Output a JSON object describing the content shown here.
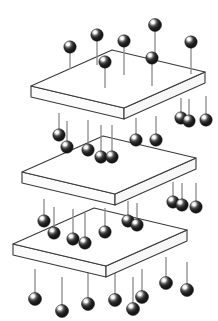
{
  "figure": {
    "title": "Three stacked plates with pin-mounted spheres",
    "background_color": "#ffffff",
    "width": 218,
    "height": 321,
    "style": {
      "plate_fill": "#ffffff",
      "plate_side_fill": "#f7f7f7",
      "plate_stroke": "#3a3a3a",
      "pin_color": "#8a8a8a",
      "sphere_dark": "#1b1b1b",
      "sphere_mid": "#3d3d3d",
      "sphere_highlight": "#ffffff",
      "sphere_outline": "#111111"
    },
    "counts": {
      "plate_count": 3,
      "sphere_count": 46,
      "pin_count": 46
    },
    "plates": [
      {
        "name": "top-plate",
        "label": "Top plate",
        "left_x": 31,
        "left_y": 86,
        "back_x": 112,
        "back_y": 50,
        "right_x": 205,
        "right_y": 72,
        "front_x": 124,
        "front_y": 108,
        "thickness": 11
      },
      {
        "name": "middle-plate",
        "label": "Middle plate",
        "left_x": 22,
        "left_y": 172,
        "back_x": 103,
        "back_y": 136,
        "right_x": 196,
        "right_y": 158,
        "front_x": 115,
        "front_y": 194,
        "thickness": 11
      },
      {
        "name": "bottom-plate",
        "label": "Bottom plate",
        "left_x": 13,
        "left_y": 244,
        "back_x": 94,
        "back_y": 208,
        "right_x": 187,
        "right_y": 230,
        "front_x": 106,
        "front_y": 266,
        "thickness": 11
      }
    ],
    "pins": [
      {
        "group": "top-above",
        "sx": 70,
        "sy": 47,
        "r": 6.2,
        "stem_len": 22
      },
      {
        "group": "top-above",
        "sx": 97,
        "sy": 35,
        "r": 6.2,
        "stem_len": 30
      },
      {
        "group": "top-above",
        "sx": 105,
        "sy": 62,
        "r": 6.2,
        "stem_len": 26
      },
      {
        "group": "top-above",
        "sx": 124,
        "sy": 41,
        "r": 6.2,
        "stem_len": 34
      },
      {
        "group": "top-above",
        "sx": 155,
        "sy": 25,
        "r": 6.5,
        "stem_len": 36
      },
      {
        "group": "top-above",
        "sx": 152,
        "sy": 58,
        "r": 6.2,
        "stem_len": 28
      },
      {
        "group": "top-above",
        "sx": 191,
        "sy": 42,
        "r": 6.2,
        "stem_len": 32
      },
      {
        "group": "top-below",
        "sx": 59,
        "sy": 135,
        "r": 6.2,
        "stem_len": 22
      },
      {
        "group": "top-below",
        "sx": 67,
        "sy": 147,
        "r": 6.2,
        "stem_len": 26
      },
      {
        "group": "top-below",
        "sx": 88,
        "sy": 150,
        "r": 6.2,
        "stem_len": 30
      },
      {
        "group": "top-below",
        "sx": 101,
        "sy": 157,
        "r": 6.2,
        "stem_len": 32
      },
      {
        "group": "top-below",
        "sx": 112,
        "sy": 157,
        "r": 6.2,
        "stem_len": 32
      },
      {
        "group": "top-below",
        "sx": 136,
        "sy": 140,
        "r": 6.2,
        "stem_len": 22
      },
      {
        "group": "top-below",
        "sx": 156,
        "sy": 140,
        "r": 6.2,
        "stem_len": 24
      },
      {
        "group": "top-below",
        "sx": 181,
        "sy": 118,
        "r": 6.2,
        "stem_len": 20
      },
      {
        "group": "top-below",
        "sx": 189,
        "sy": 121,
        "r": 6.2,
        "stem_len": 22
      },
      {
        "group": "top-below",
        "sx": 206,
        "sy": 120,
        "r": 6.2,
        "stem_len": 24
      },
      {
        "group": "mid-below",
        "sx": 44,
        "sy": 221,
        "r": 6.2,
        "stem_len": 22
      },
      {
        "group": "mid-below",
        "sx": 54,
        "sy": 233,
        "r": 6.2,
        "stem_len": 26
      },
      {
        "group": "mid-below",
        "sx": 73,
        "sy": 239,
        "r": 6.2,
        "stem_len": 30
      },
      {
        "group": "mid-below",
        "sx": 85,
        "sy": 243,
        "r": 6.2,
        "stem_len": 30
      },
      {
        "group": "mid-below",
        "sx": 105,
        "sy": 232,
        "r": 6.2,
        "stem_len": 24
      },
      {
        "group": "mid-below",
        "sx": 128,
        "sy": 221,
        "r": 6.2,
        "stem_len": 20
      },
      {
        "group": "mid-below",
        "sx": 137,
        "sy": 225,
        "r": 6.2,
        "stem_len": 22
      },
      {
        "group": "mid-below",
        "sx": 173,
        "sy": 202,
        "r": 6.2,
        "stem_len": 20
      },
      {
        "group": "mid-below",
        "sx": 182,
        "sy": 205,
        "r": 6.2,
        "stem_len": 22
      },
      {
        "group": "mid-below",
        "sx": 196,
        "sy": 207,
        "r": 6.2,
        "stem_len": 24
      },
      {
        "group": "bottom-hanging",
        "sx": 35,
        "sy": 299,
        "r": 6.5,
        "stem_len": 30
      },
      {
        "group": "bottom-hanging",
        "sx": 62,
        "sy": 311,
        "r": 6.5,
        "stem_len": 34
      },
      {
        "group": "bottom-hanging",
        "sx": 88,
        "sy": 304,
        "r": 6.5,
        "stem_len": 34
      },
      {
        "group": "bottom-hanging",
        "sx": 115,
        "sy": 300,
        "r": 6.5,
        "stem_len": 30
      },
      {
        "group": "bottom-hanging",
        "sx": 133,
        "sy": 309,
        "r": 6.5,
        "stem_len": 32
      },
      {
        "group": "bottom-hanging",
        "sx": 142,
        "sy": 297,
        "r": 6.5,
        "stem_len": 28
      },
      {
        "group": "bottom-hanging",
        "sx": 166,
        "sy": 283,
        "r": 6.5,
        "stem_len": 26
      },
      {
        "group": "bottom-hanging",
        "sx": 187,
        "sy": 290,
        "r": 6.5,
        "stem_len": 28
      }
    ]
  }
}
